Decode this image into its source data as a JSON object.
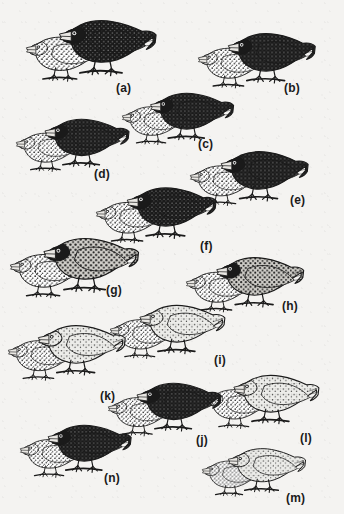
{
  "plate": {
    "title": "Plate of finch species pairs",
    "description": "Black-and-white engraving-style plate of fourteen finch groups, each a dark male beside a paler speckled female, labelled (a) through (n).",
    "background_color": "#f4f3f1",
    "ink_color": "#1a1a1a",
    "width": 344,
    "height": 514
  },
  "groups": [
    {
      "id": "a",
      "caption": "(a)",
      "caption_x": 116,
      "caption_y": 82,
      "x": 26,
      "y": 10,
      "w": 150,
      "h": 92,
      "scale": 1.0,
      "male_tone": "dark",
      "female_tone": "speckled",
      "birds": 2
    },
    {
      "id": "b",
      "caption": "(b)",
      "caption_x": 284,
      "caption_y": 82,
      "x": 198,
      "y": 24,
      "w": 136,
      "h": 82,
      "scale": 0.9,
      "male_tone": "dark",
      "female_tone": "speckled",
      "birds": 2
    },
    {
      "id": "c",
      "caption": "(c)",
      "caption_x": 198,
      "caption_y": 138,
      "x": 122,
      "y": 84,
      "w": 128,
      "h": 76,
      "scale": 0.86,
      "male_tone": "dark",
      "female_tone": "speckled",
      "birds": 2
    },
    {
      "id": "d",
      "caption": "(d)",
      "caption_x": 94,
      "caption_y": 168,
      "x": 16,
      "y": 110,
      "w": 130,
      "h": 78,
      "scale": 0.87,
      "male_tone": "dark",
      "female_tone": "speckled",
      "birds": 2
    },
    {
      "id": "e",
      "caption": "(e)",
      "caption_x": 290,
      "caption_y": 194,
      "x": 190,
      "y": 142,
      "w": 140,
      "h": 80,
      "scale": 0.9,
      "male_tone": "dark",
      "female_tone": "speckled",
      "birds": 2
    },
    {
      "id": "f",
      "caption": "(f)",
      "caption_x": 200,
      "caption_y": 240,
      "x": 96,
      "y": 178,
      "w": 140,
      "h": 82,
      "scale": 0.92,
      "male_tone": "dark",
      "female_tone": "speckled",
      "birds": 2
    },
    {
      "id": "g",
      "caption": "(g)",
      "caption_x": 106,
      "caption_y": 284,
      "x": 10,
      "y": 228,
      "w": 152,
      "h": 90,
      "scale": 0.98,
      "male_tone": "mid",
      "female_tone": "speckled",
      "birds": 2
    },
    {
      "id": "h",
      "caption": "(h)",
      "caption_x": 282,
      "caption_y": 300,
      "x": 186,
      "y": 248,
      "w": 138,
      "h": 82,
      "scale": 0.9,
      "male_tone": "mid",
      "female_tone": "speckled",
      "birds": 2
    },
    {
      "id": "i",
      "caption": "(i)",
      "caption_x": 214,
      "caption_y": 354,
      "x": 110,
      "y": 296,
      "w": 134,
      "h": 80,
      "scale": 0.88,
      "male_tone": "light",
      "female_tone": "speckled",
      "birds": 2
    },
    {
      "id": "k",
      "caption": "(k)",
      "caption_x": 100,
      "caption_y": 390,
      "x": 8,
      "y": 316,
      "w": 136,
      "h": 84,
      "scale": 0.9,
      "male_tone": "light",
      "female_tone": "speckled",
      "birds": 2
    },
    {
      "id": "l",
      "caption": "(l)",
      "caption_x": 300,
      "caption_y": 432,
      "x": 204,
      "y": 366,
      "w": 134,
      "h": 80,
      "scale": 0.88,
      "male_tone": "light",
      "female_tone": "speckled",
      "birds": 2
    },
    {
      "id": "j",
      "caption": "(j)",
      "caption_x": 196,
      "caption_y": 434,
      "x": 108,
      "y": 374,
      "w": 130,
      "h": 80,
      "scale": 0.87,
      "male_tone": "dark",
      "female_tone": "speckled",
      "birds": 2
    },
    {
      "id": "n",
      "caption": "(n)",
      "caption_x": 104,
      "caption_y": 472,
      "x": 20,
      "y": 416,
      "w": 126,
      "h": 80,
      "scale": 0.86,
      "male_tone": "dark",
      "female_tone": "speckled",
      "birds": 2
    },
    {
      "id": "m",
      "caption": "(m)",
      "caption_x": 286,
      "caption_y": 492,
      "x": 202,
      "y": 440,
      "w": 118,
      "h": 70,
      "scale": 0.8,
      "male_tone": "light",
      "female_tone": "speckled",
      "birds": 2
    }
  ]
}
